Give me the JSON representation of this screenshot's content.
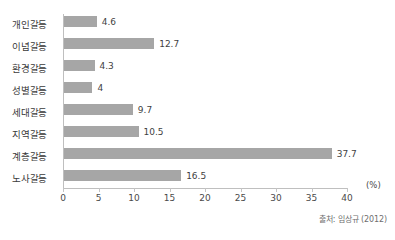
{
  "source_note": "출처: 임상규 (2012)",
  "unit_label": "(%)",
  "chart_data": {
    "type": "bar",
    "orientation": "horizontal",
    "title": "",
    "xlabel": "(%)",
    "ylabel": "",
    "xlim": [
      0,
      40
    ],
    "ticks": [
      0,
      5,
      10,
      15,
      20,
      25,
      30,
      35,
      40
    ],
    "tick_labels": [
      "0",
      "5",
      "10",
      "15",
      "20",
      "25",
      "30",
      "35",
      "40"
    ],
    "grid": false,
    "legend": false,
    "bar_color": "#a6a6a6",
    "axis_color": "#bfbfbf",
    "text_color": "#3f3f3f",
    "categories": [
      "개인갈등",
      "이념갈등",
      "환경갈등",
      "성별갈등",
      "세대갈등",
      "지역갈등",
      "계층갈등",
      "노사갈등"
    ],
    "values": [
      4.6,
      12.7,
      4.3,
      4,
      9.7,
      10.5,
      37.7,
      16.5
    ],
    "value_labels": [
      "4.6",
      "12.7",
      "4.3",
      "4",
      "9.7",
      "10.5",
      "37.7",
      "16.5"
    ],
    "source": "출처: 임상규 (2012)"
  }
}
